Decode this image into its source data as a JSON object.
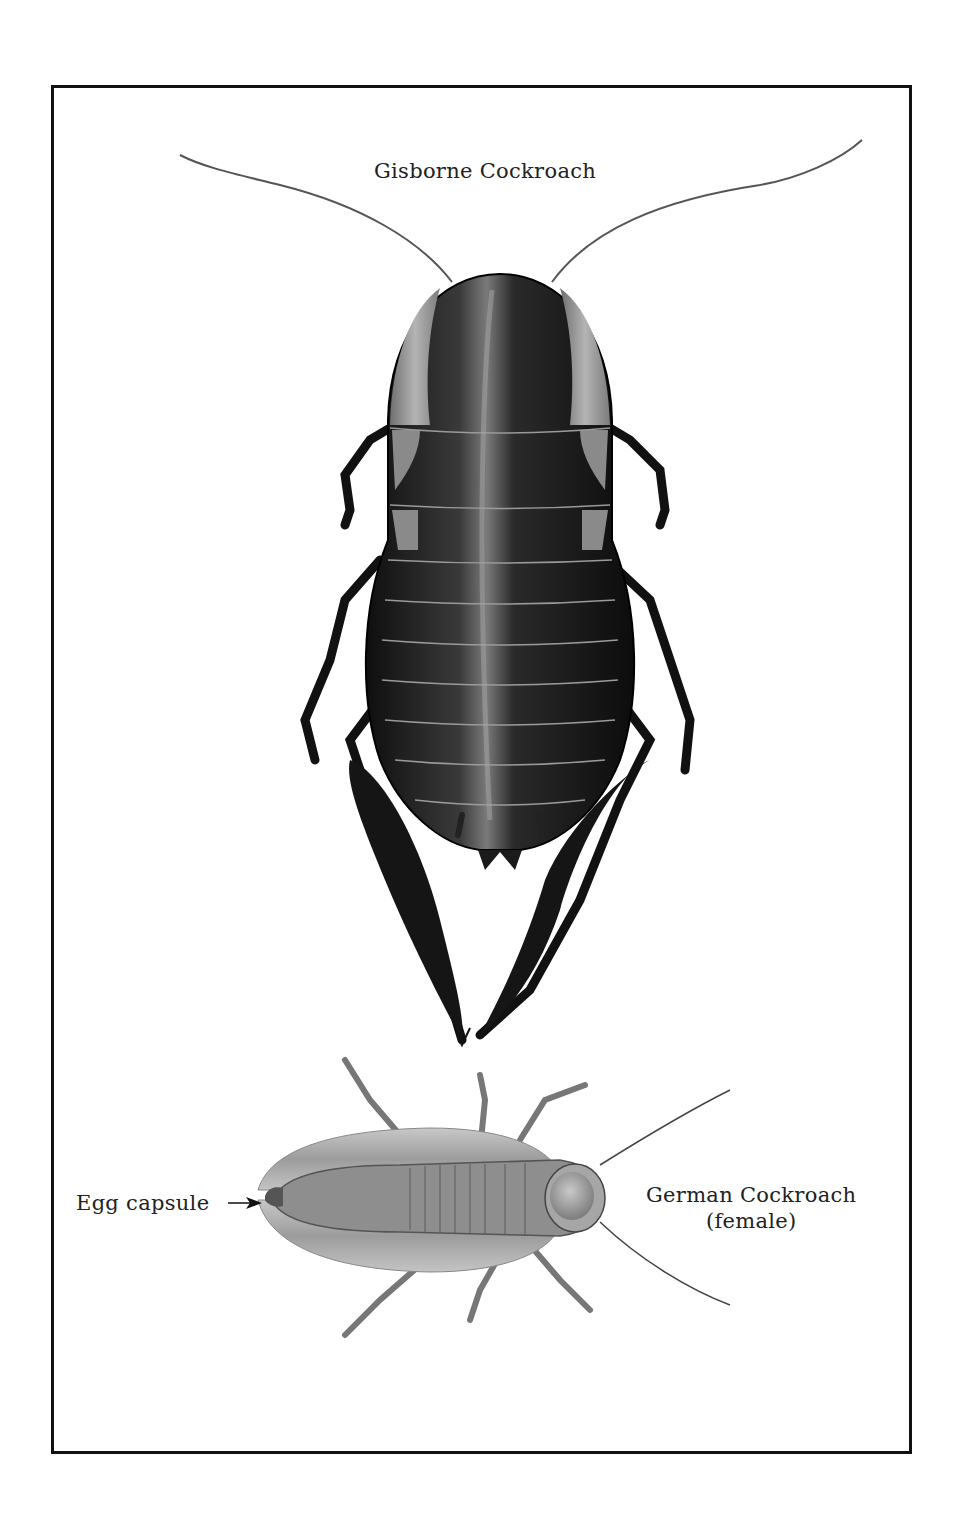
{
  "plate": {
    "border_color": "#111111",
    "background": "#ffffff"
  },
  "specimens": [
    {
      "name": "Gisborne Cockroach",
      "view": "dorsal",
      "body_color": "#1e1e1e",
      "wing_pad_color": "#9a9a9a"
    },
    {
      "name": "German Cockroach",
      "note": "(female)",
      "view": "dorsal",
      "body_color": "#8a8a8a",
      "wing_color": "#b8b8b8"
    }
  ],
  "labels": {
    "gisborne": "Gisborne Cockroach",
    "egg_capsule": "Egg capsule",
    "egg_arrow_icon": "arrow-right",
    "german_line1": "German Cockroach",
    "german_line2": "(female)"
  }
}
